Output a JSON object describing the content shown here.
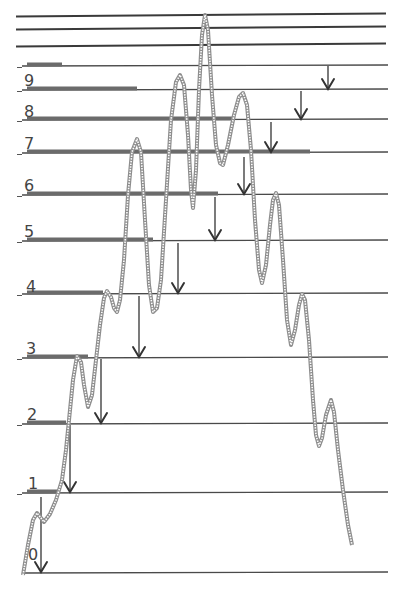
{
  "diagram": {
    "title": "",
    "level_labels": [
      "0",
      "1",
      "2",
      "3",
      "4",
      "5",
      "6",
      "7",
      "8",
      "9"
    ],
    "colors": {
      "lines": "#4a4a4a",
      "bars": "#6b6b6b",
      "curve": "#8e8e8e",
      "arrows": "#333333",
      "background": "#ffffff"
    },
    "top_lines_y": [
      15,
      28,
      45
    ],
    "levels": [
      {
        "label": "0",
        "y": 573,
        "bar_end_x": null,
        "label_x": 28,
        "label_y": 560
      },
      {
        "label": "1",
        "y": 493,
        "bar_end_x": 60,
        "label_x": 28,
        "label_y": 489
      },
      {
        "label": "2",
        "y": 424,
        "bar_end_x": 66,
        "label_x": 27,
        "label_y": 420
      },
      {
        "label": "3",
        "y": 358,
        "bar_end_x": 88,
        "label_x": 26,
        "label_y": 354
      },
      {
        "label": "4",
        "y": 294,
        "bar_end_x": 103,
        "label_x": 26,
        "label_y": 292
      },
      {
        "label": "5",
        "y": 241,
        "bar_end_x": 153,
        "label_x": 24,
        "label_y": 237
      },
      {
        "label": "6",
        "y": 195,
        "bar_end_x": 218,
        "label_x": 24,
        "label_y": 191
      },
      {
        "label": "7",
        "y": 153,
        "bar_end_x": 310,
        "label_x": 24,
        "label_y": 149
      },
      {
        "label": "8",
        "y": 120,
        "bar_end_x": 233,
        "label_x": 24,
        "label_y": 117
      },
      {
        "label": "9",
        "y": 90,
        "bar_end_x": 137,
        "label_x": 24,
        "label_y": 86
      },
      {
        "label": "",
        "y": 66,
        "bar_end_x": 62,
        "label_x": null,
        "label_y": null
      }
    ],
    "arrows": [
      {
        "x": 41,
        "y1": 497,
        "y2": 573
      },
      {
        "x": 70,
        "y1": 425,
        "y2": 493
      },
      {
        "x": 101,
        "y1": 359,
        "y2": 424
      },
      {
        "x": 139,
        "y1": 296,
        "y2": 358
      },
      {
        "x": 178,
        "y1": 243,
        "y2": 294
      },
      {
        "x": 215,
        "y1": 197,
        "y2": 241
      },
      {
        "x": 244,
        "y1": 157,
        "y2": 195
      },
      {
        "x": 271,
        "y1": 122,
        "y2": 153
      },
      {
        "x": 301,
        "y1": 91,
        "y2": 120
      },
      {
        "x": 328,
        "y1": 66,
        "y2": 90
      }
    ],
    "curve_points": [
      [
        23,
        575
      ],
      [
        28,
        545
      ],
      [
        33,
        520
      ],
      [
        37,
        513
      ],
      [
        41,
        518
      ],
      [
        44,
        522
      ],
      [
        50,
        514
      ],
      [
        56,
        500
      ],
      [
        62,
        480
      ],
      [
        66,
        450
      ],
      [
        69,
        420
      ],
      [
        73,
        380
      ],
      [
        77,
        356
      ],
      [
        81,
        362
      ],
      [
        84,
        385
      ],
      [
        88,
        407
      ],
      [
        92,
        395
      ],
      [
        96,
        360
      ],
      [
        100,
        325
      ],
      [
        104,
        298
      ],
      [
        107,
        291
      ],
      [
        111,
        297
      ],
      [
        114,
        308
      ],
      [
        117,
        312
      ],
      [
        120,
        300
      ],
      [
        124,
        260
      ],
      [
        128,
        195
      ],
      [
        132,
        152
      ],
      [
        137,
        139
      ],
      [
        141,
        152
      ],
      [
        145,
        220
      ],
      [
        149,
        285
      ],
      [
        153,
        312
      ],
      [
        157,
        308
      ],
      [
        161,
        280
      ],
      [
        166,
        200
      ],
      [
        171,
        120
      ],
      [
        176,
        82
      ],
      [
        180,
        75
      ],
      [
        184,
        85
      ],
      [
        188,
        135
      ],
      [
        191,
        190
      ],
      [
        193,
        208
      ],
      [
        196,
        170
      ],
      [
        199,
        90
      ],
      [
        202,
        35
      ],
      [
        205,
        15
      ],
      [
        208,
        30
      ],
      [
        212,
        95
      ],
      [
        216,
        145
      ],
      [
        220,
        163
      ],
      [
        223,
        165
      ],
      [
        228,
        145
      ],
      [
        234,
        115
      ],
      [
        239,
        97
      ],
      [
        243,
        93
      ],
      [
        247,
        105
      ],
      [
        251,
        150
      ],
      [
        255,
        220
      ],
      [
        259,
        270
      ],
      [
        262,
        283
      ],
      [
        266,
        265
      ],
      [
        270,
        225
      ],
      [
        273,
        200
      ],
      [
        276,
        193
      ],
      [
        279,
        205
      ],
      [
        283,
        260
      ],
      [
        287,
        320
      ],
      [
        291,
        345
      ],
      [
        295,
        330
      ],
      [
        299,
        305
      ],
      [
        302,
        294
      ],
      [
        305,
        300
      ],
      [
        309,
        340
      ],
      [
        313,
        400
      ],
      [
        316,
        435
      ],
      [
        319,
        446
      ],
      [
        322,
        438
      ],
      [
        326,
        415
      ],
      [
        331,
        400
      ],
      [
        334,
        412
      ],
      [
        338,
        450
      ],
      [
        343,
        490
      ],
      [
        348,
        525
      ],
      [
        352,
        545
      ]
    ]
  }
}
